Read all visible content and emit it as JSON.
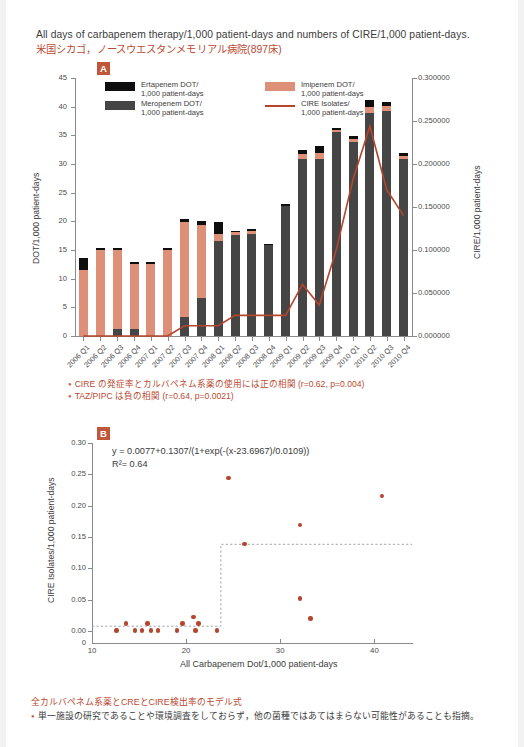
{
  "header": {
    "title": "All days of carbapenem therapy/1,000 patient-days and numbers of CIRE/1,000 patient-days.",
    "subtitle": "米国シカゴ，ノースウエスタンメモリアル病院(897床)"
  },
  "panels": {
    "a_label": "A",
    "b_label": "B"
  },
  "colors": {
    "ertapenem": "#0e0e0e",
    "meropenem": "#454545",
    "imipenem": "#dd8f77",
    "cire_line": "#b5452c",
    "accent_text": "#b94a32",
    "badge": "#c0573a"
  },
  "notes_a": [
    "CIRE の発症率とカルバペネム系薬の使用には正の相関 (r=0.62, p=0.004)",
    "TAZ/PIPC は負の相関 (r=0.64, p=0.0021)"
  ],
  "footer": {
    "heading": "全カルバペネム系薬とCREとCIRE検出率のモデル式",
    "note": "単一施設の研究であることや環境調査をしておらず，他の菌種ではあてはまらない可能性があることも指摘。"
  },
  "chart_data": [
    {
      "id": "A",
      "type": "bar",
      "title": "",
      "xlabel": "",
      "ylabel": "DOT/1,000 patient-days",
      "y2label": "CIRE/1,000 patient-days",
      "ylim": [
        0,
        45
      ],
      "yticks": [
        "0",
        "5",
        "10",
        "15",
        "20",
        "25",
        "30",
        "35",
        "40",
        "45"
      ],
      "y2lim": [
        0,
        0.3
      ],
      "y2ticks": [
        "0.000000",
        "0.050000",
        "0.100000",
        "0.150000",
        "0.200000",
        "0.250000",
        "0.300000"
      ],
      "grid": false,
      "legend_position": "top-left",
      "legend": [
        {
          "label": "Ertapenem DOT/\n1,000 patient-days",
          "label_l1": "Ertapenem DOT/",
          "label_l2": "1,000 patient-days",
          "marker": "swatch",
          "color": "#0e0e0e"
        },
        {
          "label": "Imipenem DOT/\n1,000 patient-days",
          "label_l1": "Imipenem DOT/",
          "label_l2": "1,000 patient-days",
          "marker": "swatch",
          "color": "#dd8f77"
        },
        {
          "label": "Meropenem DOT/\n1,000 patient-days",
          "label_l1": "Meropenem DOT/",
          "label_l2": "1,000 patient-days",
          "marker": "swatch",
          "color": "#454545"
        },
        {
          "label": "CIRE Isolates/\n1,000 patient-days",
          "label_l1": "CIRE Isolates/",
          "label_l2": "1,000 patient-days",
          "marker": "line",
          "color": "#b5452c"
        }
      ],
      "categories": [
        "2006 Q1",
        "2006 Q2",
        "2006 Q3",
        "2006 Q4",
        "2007 Q1",
        "2007 Q2",
        "2007 Q3",
        "2007 Q4",
        "2008 Q1",
        "2008 Q2",
        "2008 Q3",
        "2008 Q4",
        "2009 Q1",
        "2009 Q2",
        "2009 Q3",
        "2009 Q4",
        "2010 Q1",
        "2010 Q2",
        "2010 Q3",
        "2010 Q4"
      ],
      "series": [
        {
          "name": "Meropenem DOT/1,000 patient-days",
          "color": "#454545",
          "values": [
            0.0,
            0.0,
            1.2,
            1.3,
            0.0,
            0.0,
            3.3,
            6.6,
            16.6,
            17.6,
            17.8,
            15.9,
            22.6,
            30.8,
            30.8,
            35.5,
            33.9,
            38.9,
            39.2,
            30.9
          ]
        },
        {
          "name": "Imipenem DOT/1,000 patient-days",
          "color": "#dd8f77",
          "values": [
            11.5,
            15.0,
            13.8,
            11.2,
            12.6,
            15.0,
            16.6,
            12.8,
            1.2,
            0.5,
            0.5,
            0.0,
            0.0,
            0.9,
            1.1,
            0.5,
            0.4,
            1.1,
            0.9,
            0.5
          ]
        },
        {
          "name": "Ertapenem DOT/1,000 patient-days",
          "color": "#0e0e0e",
          "values": [
            2.2,
            0.4,
            0.4,
            0.4,
            0.4,
            0.4,
            0.5,
            0.6,
            2.0,
            0.3,
            0.3,
            0.2,
            0.4,
            0.8,
            1.2,
            0.3,
            0.5,
            1.2,
            0.8,
            0.6
          ]
        }
      ],
      "line_series": {
        "name": "CIRE Isolates/1,000 patient-days",
        "color": "#b5452c",
        "axis": "right",
        "values": [
          0.0,
          0.0,
          0.0,
          0.0,
          0.0,
          0.0,
          0.012,
          0.012,
          0.012,
          0.024,
          0.024,
          0.024,
          0.024,
          0.06,
          0.036,
          0.1,
          0.182,
          0.244,
          0.17,
          0.14
        ]
      }
    },
    {
      "id": "B",
      "type": "scatter",
      "title": "",
      "xlabel": "All Carbapenem Dot/1,000 patient-days",
      "ylabel": "CIRE Isolates/1,000 patient-days",
      "xlim": [
        10,
        44
      ],
      "xticks": [
        "10",
        "20",
        "30",
        "40"
      ],
      "ylim": [
        0,
        0.3
      ],
      "yticks": [
        "0",
        "0.00",
        "0.05",
        "0.10",
        "0.15",
        "0.20",
        "0.25",
        "0.30"
      ],
      "grid": false,
      "annotations": [
        "y = 0.0077+0.1307/(1+exp(-(x-23.6967)/0.0109))",
        "R²= 0.64"
      ],
      "equation": {
        "expression": "y = 0.0077+0.1307/(1+exp(-(x-23.6967)/0.0109))",
        "r_squared_label": "R²= 0.64",
        "r_squared": 0.64,
        "intercept": 0.0077,
        "amplitude": 0.1307,
        "x0": 23.6967,
        "k": 0.0109
      },
      "points": [
        {
          "x": 12.6,
          "y": 0.001
        },
        {
          "x": 13.6,
          "y": 0.012
        },
        {
          "x": 14.6,
          "y": 0.001
        },
        {
          "x": 15.3,
          "y": 0.001
        },
        {
          "x": 15.9,
          "y": 0.012
        },
        {
          "x": 16.3,
          "y": 0.001
        },
        {
          "x": 17.0,
          "y": 0.001
        },
        {
          "x": 19.0,
          "y": 0.001
        },
        {
          "x": 19.6,
          "y": 0.012
        },
        {
          "x": 20.8,
          "y": 0.022
        },
        {
          "x": 21.0,
          "y": 0.001
        },
        {
          "x": 21.3,
          "y": 0.012
        },
        {
          "x": 23.3,
          "y": 0.001
        },
        {
          "x": 24.5,
          "y": 0.244
        },
        {
          "x": 26.2,
          "y": 0.139
        },
        {
          "x": 32.1,
          "y": 0.169
        },
        {
          "x": 32.1,
          "y": 0.052
        },
        {
          "x": 33.2,
          "y": 0.02
        },
        {
          "x": 40.8,
          "y": 0.215
        }
      ],
      "model_curve_described": "dashed step-like sigmoid rising from y=0.0077 to y=0.1384 near x=23.70"
    }
  ]
}
